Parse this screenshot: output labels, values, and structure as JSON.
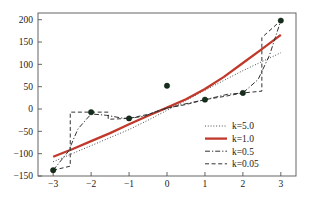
{
  "chart_data": {
    "type": "line",
    "title": "",
    "xlabel": "",
    "ylabel": "",
    "xlim": [
      -3.4,
      3.4
    ],
    "ylim": [
      -150,
      215
    ],
    "grid": false,
    "legend_position": "lower right",
    "xticks": [
      -3,
      -2,
      -1,
      0,
      1,
      2,
      3
    ],
    "xtick_labels": [
      "−3",
      "−2",
      "−1",
      "0",
      "1",
      "2",
      "3"
    ],
    "yticks": [
      -150,
      -100,
      -50,
      0,
      50,
      100,
      150,
      200
    ],
    "ytick_labels": [
      "−150",
      "−100",
      "−50",
      "0",
      "50",
      "100",
      "150",
      "200"
    ],
    "scatter": {
      "name": "data points",
      "marker": "filled-circle",
      "color": "#14301c",
      "x": [
        -3,
        -2,
        -1,
        0,
        1,
        2,
        3
      ],
      "y": [
        -137,
        -7,
        -21,
        52,
        21,
        36,
        198
      ]
    },
    "series": [
      {
        "name": "k=5.0",
        "label": "k=5.0",
        "style": "dotted",
        "color": "#3a3a3a",
        "width": 1,
        "x": [
          -3,
          -2.5,
          -2,
          -1.5,
          -1,
          -0.5,
          0,
          0.5,
          1,
          1.5,
          2,
          2.5,
          3
        ],
        "y": [
          -118,
          -100,
          -82,
          -64,
          -46,
          -25,
          -3,
          19,
          42,
          64,
          86,
          106,
          126
        ]
      },
      {
        "name": "k=1.0",
        "label": "k=1.0",
        "style": "solid",
        "color": "#c0392b",
        "width": 2.3,
        "x": [
          -3,
          -2.5,
          -2,
          -1.5,
          -1,
          -0.5,
          0,
          0.5,
          1,
          1.5,
          2,
          2.5,
          3
        ],
        "y": [
          -107,
          -90,
          -72,
          -54,
          -34,
          -15,
          3,
          22,
          45,
          72,
          103,
          134,
          166
        ]
      },
      {
        "name": "k=0.5",
        "label": "k=0.5",
        "style": "dashdot",
        "color": "#333333",
        "width": 1,
        "x": [
          -3,
          -2.6,
          -2.35,
          -2,
          -1.6,
          -1.2,
          -1,
          -0.6,
          -0.2,
          0,
          0.4,
          1,
          1.6,
          2,
          2.4,
          2.7,
          3
        ],
        "y": [
          -137,
          -95,
          -45,
          -11,
          -14,
          -20,
          -21,
          -16,
          -3,
          2,
          10,
          21,
          33,
          36,
          66,
          120,
          198
        ]
      },
      {
        "name": "k=0.05",
        "label": "k=0.05",
        "style": "dashed",
        "color": "#333333",
        "width": 1,
        "x": [
          -3,
          -2.55,
          -2.55,
          -2,
          -1.55,
          -1.55,
          -1,
          -0.5,
          0,
          0.5,
          1,
          1.5,
          2,
          2.5,
          2.5,
          3
        ],
        "y": [
          -137,
          -128,
          -7,
          -7,
          -7,
          -23,
          -21,
          -12,
          2,
          10,
          21,
          28,
          36,
          40,
          160,
          198
        ]
      }
    ],
    "legend": [
      {
        "label": "k=5.0",
        "style": "dotted",
        "color": "#3a3a3a"
      },
      {
        "label": "k=1.0",
        "style": "solid",
        "color": "#c0392b"
      },
      {
        "label": "k=0.5",
        "style": "dashdot",
        "color": "#333333"
      },
      {
        "label": "k=0.05",
        "style": "dashed",
        "color": "#333333"
      }
    ]
  },
  "axes": {
    "frame_color": "#555555"
  }
}
